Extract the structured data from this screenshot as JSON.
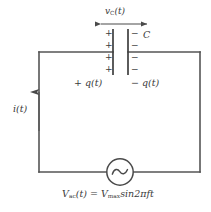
{
  "diagram": {
    "colors": {
      "wire": "#555555",
      "text": "#3a3a3a",
      "background": "#ffffff"
    },
    "labels": {
      "capacitor_voltage": "v",
      "capacitor_voltage_sub": "C",
      "capacitor_voltage_arg": "(t)",
      "capacitor_name": "C",
      "positive_charge": "+ q(t)",
      "negative_charge": "− q(t)",
      "current": "i(t)",
      "source_equation_v": "V",
      "source_equation_v_sub": "ac",
      "source_equation_rest": "(t) = V",
      "source_equation_vmax_sub": "max",
      "source_equation_tail": "sin2πft"
    },
    "plate_signs": {
      "left": [
        "+",
        "+",
        "+",
        "+"
      ],
      "right": [
        "−",
        "−",
        "−",
        "−"
      ]
    },
    "components": {
      "capacitor": "capacitor-symbol",
      "ac_source": "ac-source-symbol",
      "current_arrow": "current-arrow-up",
      "voltage_arrow": "voltage-double-arrow"
    }
  }
}
